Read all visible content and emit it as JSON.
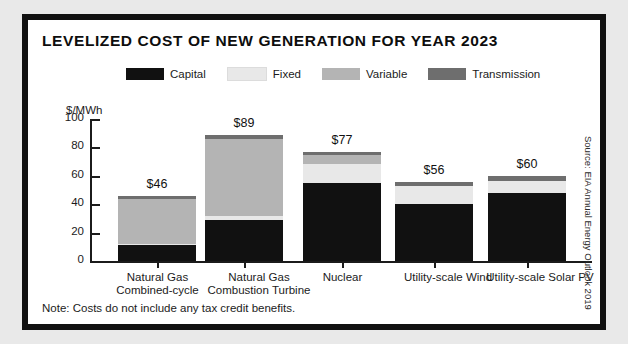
{
  "title": "LEVELIZED COST OF NEW GENERATION FOR YEAR 2023",
  "note": "Note: Costs do not include any tax credit benefits.",
  "source": "Source: EIA Annual Energy Outlook 2019",
  "colors": {
    "capital": "#111111",
    "fixed": "#e8e8e8",
    "variable": "#b4b4b4",
    "transmission": "#6e6e6e",
    "axis": "#1b1b1b",
    "frame": "#111111",
    "page_background": "#e9e9e9",
    "panel_background": "#ffffff"
  },
  "chart_data": {
    "type": "bar",
    "stacked": true,
    "title": "LEVELIZED COST OF NEW GENERATION FOR YEAR 2023",
    "xlabel": "",
    "ylabel": "$/MWh",
    "ylim": [
      0,
      100
    ],
    "yticks": [
      0,
      20,
      40,
      60,
      80,
      100
    ],
    "grid": false,
    "legend_position": "top",
    "categories": [
      "Natural Gas\nCombined-cycle",
      "Natural Gas\nCombustion Turbine",
      "Nuclear",
      "Utility-scale Wind",
      "Utility-scale Solar PV"
    ],
    "category_lines": [
      [
        "Natural Gas",
        "Combined-cycle"
      ],
      [
        "Natural Gas",
        "Combustion Turbine"
      ],
      [
        "Nuclear",
        ""
      ],
      [
        "Utility-scale Wind",
        ""
      ],
      [
        "Utility-scale Solar PV",
        ""
      ]
    ],
    "series": [
      {
        "name": "Capital",
        "color": "#111111",
        "values": [
          11,
          29,
          55,
          40,
          48
        ]
      },
      {
        "name": "Fixed",
        "color": "#e8e8e8",
        "values": [
          1,
          3,
          13,
          13,
          8
        ]
      },
      {
        "name": "Variable",
        "color": "#b4b4b4",
        "values": [
          32,
          54,
          7,
          0,
          0
        ]
      },
      {
        "name": "Transmission",
        "color": "#6e6e6e",
        "values": [
          2,
          3,
          2,
          3,
          4
        ]
      }
    ],
    "totals": [
      46,
      89,
      77,
      56,
      60
    ],
    "data_labels": [
      "$46",
      "$89",
      "$77",
      "$56",
      "$60"
    ],
    "units": "$/MWh"
  },
  "legend": [
    {
      "label": "Capital",
      "color": "#111111"
    },
    {
      "label": "Fixed",
      "color": "#e8e8e8"
    },
    {
      "label": "Variable",
      "color": "#b4b4b4"
    },
    {
      "label": "Transmission",
      "color": "#6e6e6e"
    }
  ]
}
